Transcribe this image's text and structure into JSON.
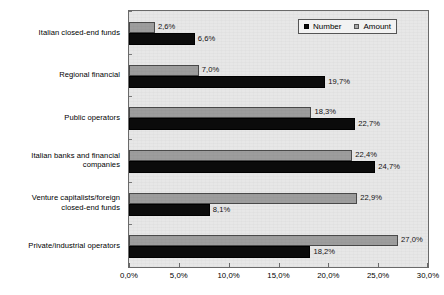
{
  "chart_data": {
    "type": "bar",
    "orientation": "horizontal",
    "title": "",
    "xlabel": "",
    "ylabel": "",
    "xlim": [
      0,
      30
    ],
    "xticks": [
      "0,0%",
      "5,0%",
      "10,0%",
      "15,0%",
      "20,0%",
      "25,0%",
      "30,0%"
    ],
    "xtick_values": [
      0,
      5,
      10,
      15,
      20,
      25,
      30
    ],
    "grid": false,
    "legend_position": "top-right",
    "categories": [
      "Italian closed-end funds",
      "Regional financial",
      "Public operators",
      "Italian banks and financial companies",
      "Venture capitalists/foreign closed-end funds",
      "Private/industrial operators"
    ],
    "series": [
      {
        "name": "Number",
        "color": "#0b0b0b",
        "values": [
          6.6,
          19.7,
          22.7,
          24.7,
          8.1,
          18.2
        ],
        "labels": [
          "6,6%",
          "19,7%",
          "22,7%",
          "24,7%",
          "8,1%",
          "18,2%"
        ]
      },
      {
        "name": "Amount",
        "color": "#9d9d9d",
        "values": [
          2.6,
          7.0,
          18.3,
          22.4,
          22.9,
          27.0
        ],
        "labels": [
          "2,6%",
          "7,0%",
          "18,3%",
          "22,4%",
          "22,9%",
          "27,0%"
        ]
      }
    ]
  },
  "legend": {
    "entries": [
      {
        "label": "Number",
        "swatch": "number-swatch-icon"
      },
      {
        "label": "Amount",
        "swatch": "amount-swatch-icon"
      }
    ]
  },
  "category_label_lines": [
    [
      "Italian closed-end funds"
    ],
    [
      "Regional financial"
    ],
    [
      "Public operators"
    ],
    [
      "Italian banks and financial",
      "companies"
    ],
    [
      "Venture capitalists/foreign",
      "closed-end funds"
    ],
    [
      "Private/industrial operators"
    ]
  ]
}
